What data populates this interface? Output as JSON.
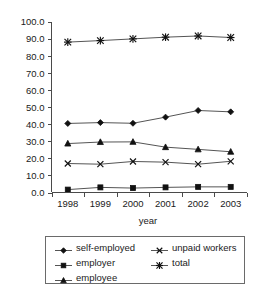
{
  "chart_data": {
    "type": "line",
    "title": "",
    "xlabel": "year",
    "ylabel": "",
    "categories": [
      "1998",
      "1999",
      "2000",
      "2001",
      "2002",
      "2003"
    ],
    "ylim": [
      0.0,
      100.0
    ],
    "ytick_step": 10.0,
    "yticks": [
      "0.0",
      "10.0",
      "20.0",
      "30.0",
      "40.0",
      "50.0",
      "60.0",
      "70.0",
      "80.0",
      "90.0",
      "100.0"
    ],
    "grid": false,
    "legend_position": "below-axes",
    "series": [
      {
        "name": "self-employed",
        "marker": "diamond",
        "values": [
          40.5,
          41.0,
          40.6,
          44.2,
          48.1,
          47.3
        ]
      },
      {
        "name": "employer",
        "marker": "square",
        "values": [
          1.7,
          3.0,
          2.6,
          3.0,
          3.3,
          3.3
        ]
      },
      {
        "name": "employee",
        "marker": "triangle",
        "values": [
          28.7,
          29.6,
          29.7,
          26.6,
          25.3,
          23.9
        ]
      },
      {
        "name": "unpaid workers",
        "marker": "x",
        "values": [
          17.0,
          16.6,
          18.2,
          17.8,
          16.6,
          18.3
        ]
      },
      {
        "name": "total",
        "marker": "asterisk",
        "values": [
          88.2,
          89.1,
          90.1,
          91.1,
          91.8,
          90.9
        ]
      }
    ],
    "colors": {
      "line": "#555555",
      "marker": "#111111",
      "axis": "#4a4a4a",
      "text": "#1a1a1a",
      "background": "#ffffff"
    }
  },
  "legend": {
    "entries": [
      {
        "label": "self-employed",
        "marker": "diamond"
      },
      {
        "label": "employer",
        "marker": "square"
      },
      {
        "label": "employee",
        "marker": "triangle"
      },
      {
        "label": "unpaid workers",
        "marker": "x"
      },
      {
        "label": "total",
        "marker": "asterisk"
      }
    ]
  },
  "axis": {
    "x_title": "year"
  }
}
